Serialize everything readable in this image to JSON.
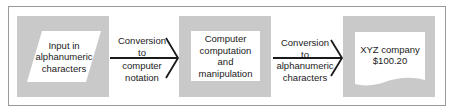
{
  "diagram": {
    "type": "flowchart",
    "direction": "left-to-right",
    "nodes": [
      {
        "id": "input",
        "shape": "parallelogram",
        "lines": [
          "Input in",
          "alphanumeric",
          "characters"
        ]
      },
      {
        "id": "compute",
        "shape": "rectangle",
        "lines": [
          "Computer",
          "computation",
          "and",
          "manipulation"
        ]
      },
      {
        "id": "output",
        "shape": "document",
        "lines": [
          "XYZ company",
          "$100.20"
        ]
      }
    ],
    "edges": [
      {
        "from": "input",
        "to": "compute",
        "lines": [
          "Conversion",
          "to",
          "computer",
          "notation"
        ]
      },
      {
        "from": "compute",
        "to": "output",
        "lines": [
          "Conversion",
          "to",
          "alphanumeric",
          "characters"
        ]
      }
    ]
  },
  "colors": {
    "panel_gray": "#c9c9c9",
    "shape_fill": "#ffffff",
    "line": "#1a1a1a",
    "frame": "#9a9a9a"
  }
}
